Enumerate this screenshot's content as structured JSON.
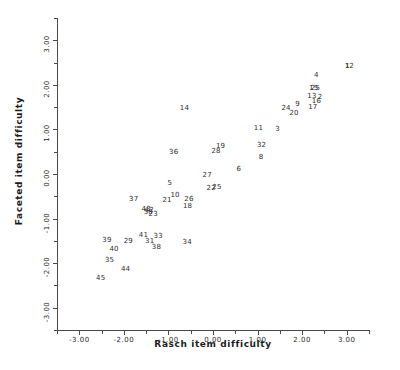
{
  "chart_data": {
    "type": "scatter",
    "title": "",
    "xlabel": "Rasch item difficulty",
    "ylabel": "Faceted item difficulty",
    "xlim": [
      -3.5,
      3.5
    ],
    "ylim": [
      -3.5,
      3.5
    ],
    "grid": false,
    "legend": "none",
    "marker_style": "numeric-label",
    "xticks": [
      "-3.00",
      "-2.00",
      "-1.00",
      "0.00",
      "1.00",
      "2.00",
      "3.00"
    ],
    "xtick_values": [
      -3,
      -2,
      -1,
      0,
      1,
      2,
      3
    ],
    "yticks": [
      "3.00",
      "2.00",
      "1.00",
      "0.00",
      "-1.00",
      "-2.00",
      "-3.00"
    ],
    "ytick_values": [
      3,
      2,
      1,
      0,
      -1,
      -2,
      -3
    ],
    "points": [
      {
        "label": "1",
        "x": 3.02,
        "y": 2.42
      },
      {
        "label": "2",
        "x": 2.4,
        "y": 1.72
      },
      {
        "label": "12",
        "x": 3.06,
        "y": 2.42
      },
      {
        "label": "4",
        "x": 2.32,
        "y": 2.22
      },
      {
        "label": "15",
        "x": 2.26,
        "y": 1.92
      },
      {
        "label": "25",
        "x": 2.3,
        "y": 1.93
      },
      {
        "label": "13",
        "x": 2.22,
        "y": 1.75
      },
      {
        "label": "16",
        "x": 2.32,
        "y": 1.64
      },
      {
        "label": "17",
        "x": 2.24,
        "y": 1.5
      },
      {
        "label": "9",
        "x": 1.9,
        "y": 1.56
      },
      {
        "label": "24",
        "x": 1.64,
        "y": 1.49
      },
      {
        "label": "20",
        "x": 1.82,
        "y": 1.37
      },
      {
        "label": "3",
        "x": 1.45,
        "y": 1.02
      },
      {
        "label": "11",
        "x": 1.02,
        "y": 1.04
      },
      {
        "label": "32",
        "x": 1.09,
        "y": 0.66
      },
      {
        "label": "8",
        "x": 1.08,
        "y": 0.38
      },
      {
        "label": "19",
        "x": 0.17,
        "y": 0.62
      },
      {
        "label": "28",
        "x": 0.07,
        "y": 0.52
      },
      {
        "label": "6",
        "x": 0.58,
        "y": 0.12
      },
      {
        "label": "27",
        "x": -0.13,
        "y": -0.03
      },
      {
        "label": "22",
        "x": -0.04,
        "y": -0.31
      },
      {
        "label": "25b",
        "x": 0.09,
        "y": -0.29
      },
      {
        "label": "14",
        "x": -0.64,
        "y": 1.48
      },
      {
        "label": "36",
        "x": -0.88,
        "y": 0.5
      },
      {
        "label": "5",
        "x": -0.97,
        "y": -0.2
      },
      {
        "label": "10",
        "x": -0.85,
        "y": -0.46
      },
      {
        "label": "21",
        "x": -1.03,
        "y": -0.59
      },
      {
        "label": "26",
        "x": -0.54,
        "y": -0.56
      },
      {
        "label": "18",
        "x": -0.57,
        "y": -0.71
      },
      {
        "label": "37",
        "x": -1.78,
        "y": -0.57
      },
      {
        "label": "43",
        "x": -1.5,
        "y": -0.79
      },
      {
        "label": "42",
        "x": -1.43,
        "y": -0.8
      },
      {
        "label": "30",
        "x": -1.45,
        "y": -0.86
      },
      {
        "label": "23",
        "x": -1.34,
        "y": -0.9
      },
      {
        "label": "41",
        "x": -1.56,
        "y": -1.36
      },
      {
        "label": "33",
        "x": -1.23,
        "y": -1.38
      },
      {
        "label": "29",
        "x": -1.9,
        "y": -1.5
      },
      {
        "label": "31",
        "x": -1.42,
        "y": -1.5
      },
      {
        "label": "39",
        "x": -2.38,
        "y": -1.47
      },
      {
        "label": "34",
        "x": -0.58,
        "y": -1.52
      },
      {
        "label": "38",
        "x": -1.27,
        "y": -1.64
      },
      {
        "label": "40",
        "x": -2.22,
        "y": -1.68
      },
      {
        "label": "35",
        "x": -2.32,
        "y": -1.93
      },
      {
        "label": "44",
        "x": -1.96,
        "y": -2.14
      },
      {
        "label": "45",
        "x": -2.52,
        "y": -2.34
      }
    ]
  },
  "axes": {
    "x_title": "Rasch item difficulty",
    "y_title": "Faceted item difficulty",
    "x_tick_labels": [
      "-3.00",
      "-2.00",
      "-1.00",
      "0.00",
      "1.00",
      "2.00",
      "3.00"
    ],
    "y_tick_labels": [
      "3.00",
      "2.00",
      "1.00",
      "0.00",
      "-1.00",
      "-2.00",
      "-3.00"
    ]
  },
  "colors": {
    "background": "#ffffff",
    "axis": "#4a4a4a",
    "text": "#2b2b2b",
    "point_label": "#2d2d2d"
  }
}
